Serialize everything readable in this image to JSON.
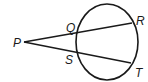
{
  "diagram": {
    "type": "secant-secant from external point",
    "stroke_color": "#1a1a1a",
    "background": "#ffffff",
    "circle": {
      "cx": 107,
      "cy": 42,
      "rx": 31,
      "ry": 38
    },
    "points": {
      "P": {
        "label": "P",
        "x": 24,
        "y": 42
      },
      "Q": {
        "label": "Q",
        "x": 77,
        "y": 33
      },
      "R": {
        "label": "R",
        "x": 132,
        "y": 23
      },
      "S": {
        "label": "S",
        "x": 77,
        "y": 52
      },
      "T": {
        "label": "T",
        "x": 131,
        "y": 63
      }
    },
    "segments": [
      {
        "name": "PR",
        "from": "P",
        "to": "R"
      },
      {
        "name": "PT",
        "from": "P",
        "to": "T"
      }
    ]
  }
}
